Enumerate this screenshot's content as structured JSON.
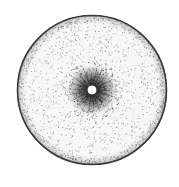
{
  "image": {
    "description": "Grayscale circular disc with speckled texture, dark radial starburst cluster around a small central hole",
    "width": 179,
    "height": 187,
    "background": "#ffffff",
    "disc": {
      "cx": 92,
      "cy": 90,
      "r": 75,
      "rim_color": "#3a3a3a",
      "fill_color": "#f7f7f7",
      "speckle_color": "#555555"
    },
    "cluster": {
      "cx": 92,
      "cy": 90,
      "r": 25,
      "color": "#333333",
      "spokes": 22
    },
    "hole": {
      "cx": 92,
      "cy": 90,
      "r": 5,
      "color": "#ffffff"
    }
  }
}
